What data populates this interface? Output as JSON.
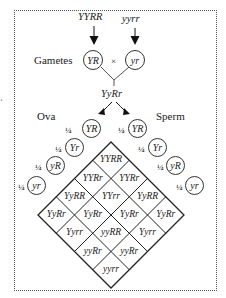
{
  "parents": {
    "left": "YYRR",
    "right": "yyrr"
  },
  "gametes_label": "Gametes",
  "gametes": {
    "left": "YR",
    "cross": "×",
    "right": "yr"
  },
  "f1": "YyRr",
  "ova_label": "Ova",
  "sperm_label": "Sperm",
  "ova": [
    {
      "frac": "¼",
      "allele": "YR"
    },
    {
      "frac": "¼",
      "allele": "Yr"
    },
    {
      "frac": "¼",
      "allele": "yR"
    },
    {
      "frac": "¼",
      "allele": "yr"
    }
  ],
  "sperm": [
    {
      "frac": "¼",
      "allele": "YR"
    },
    {
      "frac": "¼",
      "allele": "Yr"
    },
    {
      "frac": "¼",
      "allele": "yR"
    },
    {
      "frac": "¼",
      "allele": "yr"
    }
  ],
  "grid_rows": [
    [
      "YYRR"
    ],
    [
      "YYRr",
      "YYRr"
    ],
    [
      "YyRR",
      "YYrr",
      "YyRR"
    ],
    [
      "YyRr",
      "YyRr",
      "YyRr",
      "YyRr"
    ],
    [
      "Yyrr",
      "yyRR",
      "Yyrr"
    ],
    [
      "yyRr",
      "yyRr"
    ],
    [
      "yyrr"
    ]
  ],
  "left_edge_mark": "¼"
}
